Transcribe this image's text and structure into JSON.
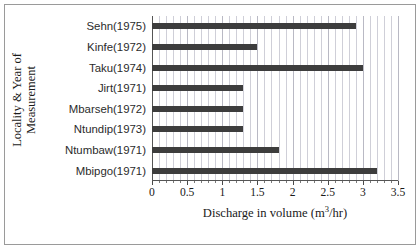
{
  "chart_data": {
    "type": "bar",
    "orientation": "horizontal",
    "title": "",
    "xlabel": "Discharge in volume (m3/hr)",
    "xlabel_parts": {
      "pre": "Discharge in volume (m",
      "sup": "3",
      "post": "/hr)"
    },
    "ylabel": "Locality & Year of Measurement",
    "ylabel_line1": "Locality & Year of",
    "ylabel_line2": "Measurement",
    "categories": [
      "Sehn(1975)",
      "Kinfe(1972)",
      "Taku(1974)",
      "Jirt(1971)",
      "Mbarseh(1972)",
      "Ntundip(1973)",
      "Ntumbaw(1971)",
      "Mbipgo(1971)"
    ],
    "values": [
      2.9,
      1.5,
      3.0,
      1.3,
      1.3,
      1.3,
      1.8,
      3.2
    ],
    "xlim": [
      0,
      3.5
    ],
    "xticks": [
      0,
      0.5,
      1,
      1.5,
      2,
      2.5,
      3,
      3.5
    ],
    "xtick_labels": [
      "0",
      "0.5",
      "1",
      "1.5",
      "2",
      "2.5",
      "3",
      "3.5"
    ],
    "minor_tick_step": 0.1,
    "grid": true,
    "grid_axis": "x",
    "legend": false,
    "bar_color": "#3d3d3d",
    "grid_color": "#b9b9c4",
    "axis_color": "#555555",
    "frame_color": "#9a9a9a",
    "background": "#ffffff"
  }
}
